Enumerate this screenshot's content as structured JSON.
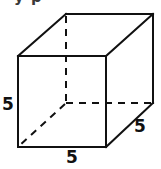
{
  "figure": {
    "name": "cube-with-edge-labels",
    "background_color": "#ffffff",
    "line_color": "#111111",
    "line_width": 2,
    "labels": {
      "left_edge": "5",
      "bottom_edge": "5",
      "right_edge": "5"
    },
    "clipped_header_text": "y     p",
    "geometry": {
      "front_face": {
        "top_left": [
          18,
          56
        ],
        "top_right": [
          106,
          56
        ],
        "bottom_right": [
          106,
          147
        ],
        "bottom_left": [
          18,
          147
        ]
      },
      "back_face": {
        "top_left": [
          66,
          14
        ],
        "top_right": [
          153,
          14
        ],
        "bottom_right": [
          153,
          103
        ],
        "bottom_left": [
          66,
          103
        ]
      },
      "solid_edges": [
        [
          [
            18,
            56
          ],
          [
            106,
            56
          ]
        ],
        [
          [
            106,
            56
          ],
          [
            106,
            147
          ]
        ],
        [
          [
            106,
            147
          ],
          [
            18,
            147
          ]
        ],
        [
          [
            18,
            147
          ],
          [
            18,
            56
          ]
        ],
        [
          [
            18,
            56
          ],
          [
            66,
            14
          ]
        ],
        [
          [
            66,
            14
          ],
          [
            153,
            14
          ]
        ],
        [
          [
            153,
            14
          ],
          [
            153,
            103
          ]
        ],
        [
          [
            106,
            56
          ],
          [
            153,
            14
          ]
        ],
        [
          [
            106,
            147
          ],
          [
            153,
            103
          ]
        ]
      ],
      "dashed_edges": [
        [
          [
            66,
            14
          ],
          [
            66,
            103
          ]
        ],
        [
          [
            66,
            103
          ],
          [
            153,
            103
          ]
        ],
        [
          [
            66,
            103
          ],
          [
            18,
            147
          ]
        ]
      ]
    }
  }
}
